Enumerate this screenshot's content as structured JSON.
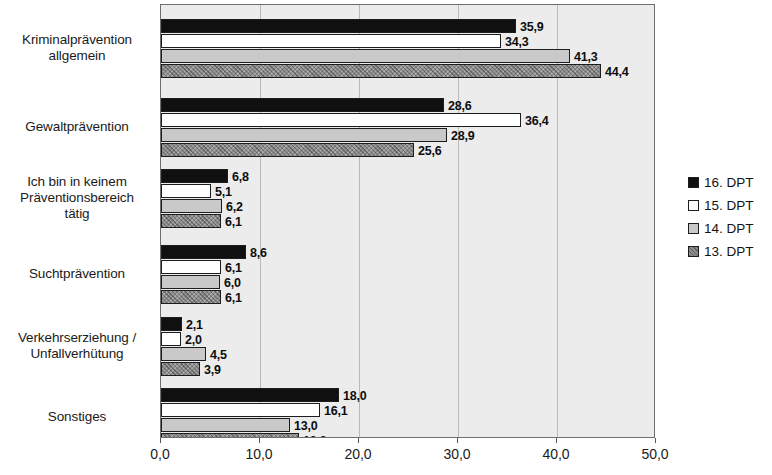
{
  "chart_data": {
    "type": "bar",
    "orientation": "horizontal",
    "title": "",
    "subtitle": "",
    "xlabel": "",
    "ylabel": "",
    "xlim": [
      0,
      50
    ],
    "xticks": [
      "0,0",
      "10,0",
      "20,0",
      "30,0",
      "40,0",
      "50,0"
    ],
    "xtick_values": [
      0,
      10,
      20,
      30,
      40,
      50
    ],
    "grid": "vertical",
    "legend_position": "right",
    "decimal_separator": ",",
    "categories": [
      "Kriminalprävention allgemein",
      "Gewaltprävention",
      "Ich bin in keinem Präventionsbereich tätig",
      "Suchtprävention",
      "Verkehrserziehung / Unfallverhütung",
      "Sonstiges"
    ],
    "category_lines": [
      [
        "Kriminalprävention",
        "allgemein"
      ],
      [
        "Gewaltprävention"
      ],
      [
        "Ich bin in keinem",
        "Präventionsbereich",
        "tätig"
      ],
      [
        "Suchtprävention"
      ],
      [
        "Verkehrserziehung /",
        "Unfallverhütung"
      ],
      [
        "Sonstiges"
      ]
    ],
    "series": [
      {
        "name": "16. DPT",
        "color": "#101010",
        "style": "solid-black",
        "values": [
          35.9,
          28.6,
          6.8,
          8.6,
          2.1,
          18.0
        ],
        "labels": [
          "35,9",
          "28,6",
          "6,8",
          "8,6",
          "2,1",
          "18,0"
        ]
      },
      {
        "name": "15. DPT",
        "color": "#ffffff",
        "style": "solid-white",
        "values": [
          34.3,
          36.4,
          5.1,
          6.1,
          2.0,
          16.1
        ],
        "labels": [
          "34,3",
          "36,4",
          "5,1",
          "6,1",
          "2,0",
          "16,1"
        ]
      },
      {
        "name": "14. DPT",
        "color": "#c9c9c9",
        "style": "solid-light-gray",
        "values": [
          41.3,
          28.9,
          6.2,
          6.0,
          4.5,
          13.0
        ],
        "labels": [
          "41,3",
          "28,9",
          "6,2",
          "6,0",
          "4,5",
          "13,0"
        ]
      },
      {
        "name": "13. DPT",
        "color": "#8c8c8c",
        "style": "hatched-gray",
        "values": [
          44.4,
          25.6,
          6.1,
          6.1,
          3.9,
          13.9
        ],
        "labels": [
          "44,4",
          "25,6",
          "6,1",
          "6,1",
          "3,9",
          "13,9"
        ]
      }
    ]
  },
  "legend": {
    "entries": [
      {
        "label": "16. DPT",
        "swatch": "s16"
      },
      {
        "label": "15. DPT",
        "swatch": "s15"
      },
      {
        "label": "14. DPT",
        "swatch": "s14"
      },
      {
        "label": "13. DPT",
        "swatch": "s13"
      }
    ]
  }
}
